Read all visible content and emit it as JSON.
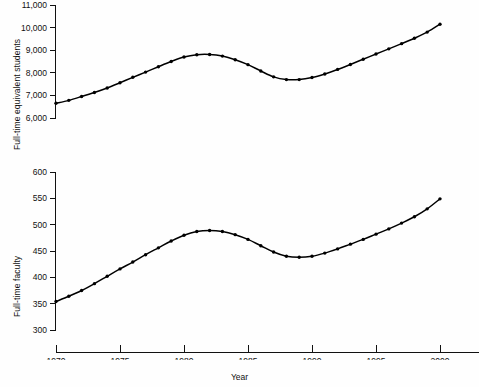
{
  "chart_data": [
    {
      "type": "line",
      "title": "",
      "xlabel": "Year",
      "ylabel": "Full-time equivalent students",
      "xlim": [
        1969,
        2002
      ],
      "ylim": [
        6000,
        11000
      ],
      "yticks": [
        6000,
        7000,
        8000,
        9000,
        10000,
        11000
      ],
      "ytick_labels": [
        "6,000",
        "7,000",
        "8,000",
        "9,000",
        "10,000",
        "11,000"
      ],
      "xticks": [
        1970,
        1975,
        1980,
        1985,
        1990,
        1995,
        2000
      ],
      "xtick_labels": [
        "1970",
        "1975",
        "1980",
        "1985",
        "1990",
        "1995",
        "2000"
      ],
      "grid": false,
      "legend": "none",
      "marker": "filled-circle",
      "x": [
        1970,
        1971,
        1972,
        1973,
        1974,
        1975,
        1976,
        1977,
        1978,
        1979,
        1980,
        1981,
        1982,
        1983,
        1984,
        1985,
        1986,
        1987,
        1988,
        1989,
        1990,
        1991,
        1992,
        1993,
        1994,
        1995,
        1996,
        1997,
        1998,
        1999,
        2000
      ],
      "values": [
        6650,
        6780,
        6950,
        7130,
        7330,
        7560,
        7800,
        8030,
        8270,
        8500,
        8700,
        8800,
        8810,
        8740,
        8580,
        8360,
        8080,
        7820,
        7700,
        7700,
        7790,
        7950,
        8150,
        8370,
        8600,
        8830,
        9060,
        9290,
        9530,
        9800,
        10150
      ]
    },
    {
      "type": "line",
      "title": "",
      "xlabel": "Year",
      "ylabel": "Full-time faculty",
      "xlim": [
        1969,
        2002
      ],
      "ylim": [
        300,
        620
      ],
      "yticks": [
        300,
        350,
        400,
        450,
        500,
        550,
        600
      ],
      "ytick_labels": [
        "300",
        "350",
        "400",
        "450",
        "500",
        "550",
        "600"
      ],
      "xticks": [
        1970,
        1975,
        1980,
        1985,
        1990,
        1995,
        2000
      ],
      "xtick_labels": [
        "1970",
        "1975",
        "1980",
        "1985",
        "1990",
        "1995",
        "2000"
      ],
      "grid": false,
      "legend": "none",
      "marker": "filled-circle",
      "x": [
        1970,
        1971,
        1972,
        1973,
        1974,
        1975,
        1976,
        1977,
        1978,
        1979,
        1980,
        1981,
        1982,
        1983,
        1984,
        1985,
        1986,
        1987,
        1988,
        1989,
        1990,
        1991,
        1992,
        1993,
        1994,
        1995,
        1996,
        1997,
        1998,
        1999,
        2000
      ],
      "values": [
        354,
        364,
        375,
        388,
        402,
        416,
        429,
        443,
        456,
        469,
        480,
        487,
        489,
        487,
        481,
        472,
        460,
        448,
        440,
        438,
        440,
        446,
        454,
        463,
        472,
        482,
        492,
        503,
        515,
        530,
        549
      ]
    }
  ],
  "labels": {
    "students_axis_title": "Full-time equivalent students",
    "faculty_axis_title": "Full-time faculty",
    "x_axis_title": "Year"
  }
}
